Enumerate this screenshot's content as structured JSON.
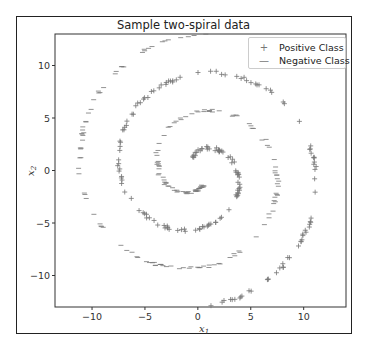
{
  "chart_data": {
    "type": "scatter",
    "title": "Sample two-spiral data",
    "xlabel": "x1",
    "ylabel": "x2",
    "xlim": [
      -13.5,
      14
    ],
    "ylim": [
      -13,
      13
    ],
    "xticks": [
      -10,
      -5,
      0,
      5,
      10
    ],
    "yticks": [
      -10,
      -5,
      0,
      5,
      10
    ],
    "grid": false,
    "legend_position": "upper right",
    "series": [
      {
        "name": "Positive Class",
        "marker": "+",
        "color": "#777777",
        "generator": {
          "type": "archimedean_spiral",
          "r_per_rad": 1.18,
          "theta_start": 1.2,
          "theta_end": 11.2,
          "n": 190,
          "rotation": 0.0,
          "sign": 1
        }
      },
      {
        "name": "Negative Class",
        "marker": "_",
        "color": "#777777",
        "generator": {
          "type": "archimedean_spiral",
          "r_per_rad": 1.18,
          "theta_start": 1.2,
          "theta_end": 11.2,
          "n": 190,
          "rotation": 0.0,
          "sign": -1
        }
      }
    ]
  },
  "labels": {
    "title": "Sample two-spiral data",
    "xlabel_main": "x",
    "xlabel_sub": "1",
    "ylabel_main": "x",
    "ylabel_sub": "2",
    "legend_pos": "Positive Class",
    "legend_neg": "Negative Class",
    "legend_pos_marker": "+",
    "legend_neg_marker": "—"
  }
}
